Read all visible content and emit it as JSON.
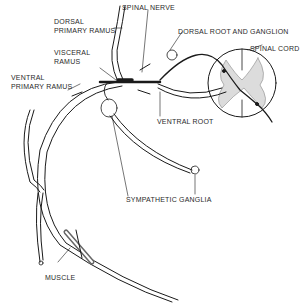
{
  "diagram": {
    "labels": {
      "spinal_nerve": "SPINAL NERVE",
      "dorsal_primary_ramus_1": "DORSAL",
      "dorsal_primary_ramus_2": "PRIMARY RAMUS",
      "dorsal_root_ganglion": "DORSAL ROOT AND GANGLION",
      "spinal_cord": "SPINAL CORD",
      "visceral_ramus_1": "VISCERAL",
      "visceral_ramus_2": "RAMUS",
      "ventral_primary_ramus_1": "VENTRAL",
      "ventral_primary_ramus_2": "PRIMARY RAMUS",
      "ventral_root": "VENTRAL ROOT",
      "sympathetic_ganglia": "SYMPATHETIC GANGLIA",
      "muscle": "MUSCLE"
    },
    "colors": {
      "line": "#1a1a1a",
      "gray_matter": "#d8d8d8",
      "background": "#ffffff"
    }
  }
}
